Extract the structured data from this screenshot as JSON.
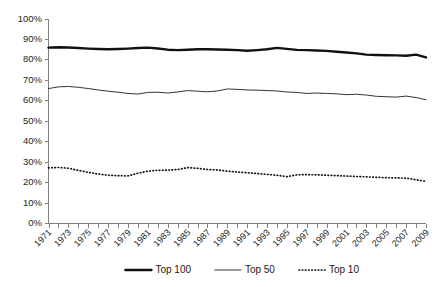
{
  "chart_data": {
    "type": "line",
    "title": "",
    "subtitle": "",
    "xlabel": "",
    "ylabel": "",
    "ylim": [
      0,
      100
    ],
    "xlim": [
      1971,
      2009
    ],
    "grid": false,
    "legend_position": "bottom",
    "y_tick_labels": [
      "100%",
      "90%",
      "80%",
      "70%",
      "60%",
      "50%",
      "40%",
      "30%",
      "20%",
      "10%",
      "0%"
    ],
    "y_tick_values": [
      100,
      90,
      80,
      70,
      60,
      50,
      40,
      30,
      20,
      10,
      0
    ],
    "x": [
      1971,
      1972,
      1973,
      1974,
      1975,
      1976,
      1977,
      1978,
      1979,
      1980,
      1981,
      1982,
      1983,
      1984,
      1985,
      1986,
      1987,
      1988,
      1989,
      1990,
      1991,
      1992,
      1993,
      1994,
      1995,
      1996,
      1997,
      1998,
      1999,
      2000,
      2001,
      2002,
      2003,
      2004,
      2005,
      2006,
      2007,
      2008,
      2009
    ],
    "x_tick_labels": [
      "1971",
      "1973",
      "1975",
      "1977",
      "1979",
      "1981",
      "1983",
      "1985",
      "1987",
      "1989",
      "1991",
      "1993",
      "1995",
      "1997",
      "1999",
      "2001",
      "2003",
      "2005",
      "2007",
      "2009"
    ],
    "x_tick_label_values": [
      1971,
      1973,
      1975,
      1977,
      1979,
      1981,
      1983,
      1985,
      1987,
      1989,
      1991,
      1993,
      1995,
      1997,
      1999,
      2001,
      2003,
      2005,
      2007,
      2009
    ],
    "series": [
      {
        "name": "Top 100",
        "style": "thick-solid",
        "color": "#111111",
        "values": [
          86.0,
          86.2,
          86.1,
          85.8,
          85.5,
          85.3,
          85.2,
          85.3,
          85.5,
          85.8,
          86.0,
          85.6,
          85.0,
          84.8,
          85.0,
          85.2,
          85.2,
          85.1,
          85.0,
          84.8,
          84.5,
          84.8,
          85.2,
          85.9,
          85.4,
          84.9,
          84.8,
          84.6,
          84.4,
          84.0,
          83.6,
          83.2,
          82.6,
          82.4,
          82.3,
          82.2,
          82.0,
          82.6,
          81.2
        ]
      },
      {
        "name": "Top 50",
        "style": "thin-solid",
        "color": "#333333",
        "values": [
          66.0,
          66.8,
          67.0,
          66.6,
          66.0,
          65.3,
          64.7,
          64.2,
          63.6,
          63.3,
          64.1,
          64.2,
          63.8,
          64.3,
          65.0,
          64.7,
          64.4,
          64.8,
          65.8,
          65.6,
          65.3,
          65.2,
          65.0,
          64.8,
          64.3,
          64.1,
          63.6,
          63.8,
          63.6,
          63.4,
          63.0,
          63.2,
          62.8,
          62.2,
          62.0,
          61.8,
          62.3,
          61.6,
          60.5
        ]
      },
      {
        "name": "Top 10",
        "style": "dotted",
        "color": "#111111",
        "values": [
          27.2,
          27.4,
          27.0,
          26.0,
          25.0,
          24.2,
          23.6,
          23.4,
          23.3,
          24.6,
          25.6,
          26.0,
          26.1,
          26.4,
          27.3,
          27.0,
          26.4,
          26.2,
          25.6,
          25.2,
          24.8,
          24.4,
          24.0,
          23.6,
          22.9,
          23.8,
          23.9,
          23.8,
          23.6,
          23.4,
          23.2,
          23.0,
          22.8,
          22.6,
          22.4,
          22.3,
          22.2,
          21.4,
          20.6
        ]
      }
    ],
    "legend": [
      {
        "label": "Top 100",
        "style": "thick-solid"
      },
      {
        "label": "Top 50",
        "style": "thin-solid"
      },
      {
        "label": "Top 10",
        "style": "dotted"
      }
    ]
  }
}
